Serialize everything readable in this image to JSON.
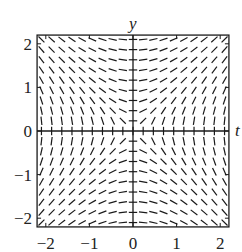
{
  "diagram": {
    "type": "slope_field",
    "equation": "dy/dt = t / y",
    "axes": {
      "x_label": "t",
      "y_label": "y",
      "x_range": [
        -2.2,
        2.2
      ],
      "y_range": [
        -2.2,
        2.2
      ],
      "x_ticks": [
        "-2",
        "-1",
        "0",
        "1",
        "2"
      ],
      "y_ticks": [
        "2",
        "1",
        "0",
        "-1",
        "-2"
      ]
    },
    "grid_points": 19,
    "colors": {
      "segments": "#1a1a1a",
      "frame": "#1a1a1a",
      "background": "#ffffff"
    }
  }
}
